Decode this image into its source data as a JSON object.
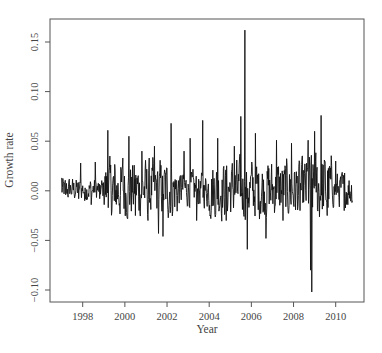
{
  "chart_data": {
    "type": "line",
    "title": "",
    "xlabel": "Year",
    "ylabel": "Growth rate",
    "xlim": [
      1996.5,
      2011.35
    ],
    "ylim": [
      -0.112,
      0.175
    ],
    "x_ticks": [
      1998,
      2000,
      2002,
      2004,
      2006,
      2008,
      2010
    ],
    "x_tick_labels": [
      "1998",
      "2000",
      "2002",
      "2004",
      "2006",
      "2008",
      "2010"
    ],
    "y_ticks": [
      -0.1,
      -0.05,
      0.0,
      0.05,
      0.1,
      0.15
    ],
    "y_tick_labels": [
      "-0.10",
      "-0.05",
      "0.00",
      "0.05",
      "0.10",
      "0.15"
    ],
    "grid": false,
    "legend": null,
    "line_color": "#111111",
    "series": [
      {
        "name": "Growth rate",
        "frequency": "weekly (approx.)",
        "x_start": 1997.0,
        "x_end": 2010.8,
        "key_points": [
          {
            "x": 1997.0,
            "y": 0.013
          },
          {
            "x": 1997.2,
            "y": -0.004
          },
          {
            "x": 1997.5,
            "y": 0.004
          },
          {
            "x": 1997.8,
            "y": -0.008
          },
          {
            "x": 1997.9,
            "y": 0.028
          },
          {
            "x": 1998.1,
            "y": -0.01
          },
          {
            "x": 1998.4,
            "y": -0.014
          },
          {
            "x": 1998.6,
            "y": 0.029
          },
          {
            "x": 1998.8,
            "y": -0.008
          },
          {
            "x": 1999.2,
            "y": 0.061
          },
          {
            "x": 1999.5,
            "y": -0.01
          },
          {
            "x": 1999.9,
            "y": 0.033
          },
          {
            "x": 2000.2,
            "y": 0.055
          },
          {
            "x": 2000.5,
            "y": -0.025
          },
          {
            "x": 2000.8,
            "y": 0.04
          },
          {
            "x": 2001.1,
            "y": -0.03
          },
          {
            "x": 2001.4,
            "y": 0.045
          },
          {
            "x": 2001.6,
            "y": -0.043
          },
          {
            "x": 2001.8,
            "y": -0.046
          },
          {
            "x": 2002.2,
            "y": 0.068
          },
          {
            "x": 2002.5,
            "y": -0.005
          },
          {
            "x": 2002.8,
            "y": 0.04
          },
          {
            "x": 2003.1,
            "y": 0.053
          },
          {
            "x": 2003.4,
            "y": -0.03
          },
          {
            "x": 2003.7,
            "y": 0.071
          },
          {
            "x": 2004.0,
            "y": -0.02
          },
          {
            "x": 2004.4,
            "y": 0.053
          },
          {
            "x": 2004.8,
            "y": -0.03
          },
          {
            "x": 2005.2,
            "y": 0.045
          },
          {
            "x": 2005.5,
            "y": 0.075
          },
          {
            "x": 2005.7,
            "y": 0.162
          },
          {
            "x": 2005.8,
            "y": -0.059
          },
          {
            "x": 2006.2,
            "y": 0.058
          },
          {
            "x": 2006.7,
            "y": -0.048
          },
          {
            "x": 2007.2,
            "y": 0.051
          },
          {
            "x": 2007.5,
            "y": -0.03
          },
          {
            "x": 2007.9,
            "y": 0.048
          },
          {
            "x": 2008.3,
            "y": -0.02
          },
          {
            "x": 2008.7,
            "y": 0.051
          },
          {
            "x": 2008.8,
            "y": -0.08
          },
          {
            "x": 2008.87,
            "y": -0.102
          },
          {
            "x": 2009.0,
            "y": 0.06
          },
          {
            "x": 2009.3,
            "y": 0.076
          },
          {
            "x": 2009.6,
            "y": -0.025
          },
          {
            "x": 2010.0,
            "y": 0.03
          },
          {
            "x": 2010.4,
            "y": -0.02
          },
          {
            "x": 2010.8,
            "y": -0.01
          }
        ],
        "noise_amplitude": [
          {
            "from": 1997.0,
            "to": 1999.0,
            "amp": 0.008
          },
          {
            "from": 1999.0,
            "to": 2002.5,
            "amp": 0.02
          },
          {
            "from": 2002.5,
            "to": 2004.0,
            "amp": 0.012
          },
          {
            "from": 2004.0,
            "to": 2008.6,
            "amp": 0.02
          },
          {
            "from": 2008.6,
            "to": 2009.8,
            "amp": 0.025
          },
          {
            "from": 2009.8,
            "to": 2010.8,
            "amp": 0.012
          }
        ]
      }
    ],
    "plot_box": {
      "left": 50,
      "top": 19,
      "right": 364,
      "bottom": 302
    }
  }
}
